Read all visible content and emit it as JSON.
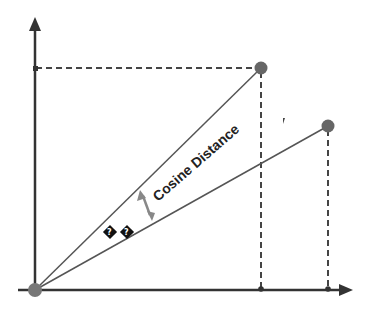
{
  "diagram": {
    "label": "Cosine Distance",
    "unknown_glyph": "?",
    "colors": {
      "axis": "#333333",
      "vector": "#555555",
      "point": "#666666",
      "arrow": "#888888",
      "text": "#222222"
    },
    "vectors": [
      {
        "name": "vector-a",
        "x": 0.72,
        "y": 0.82
      },
      {
        "name": "vector-b",
        "x": 0.93,
        "y": 0.6
      }
    ]
  }
}
